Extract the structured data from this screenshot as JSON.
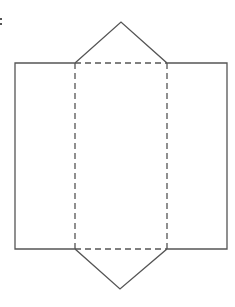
{
  "figure": {
    "colors": {
      "stroke": "#555555",
      "background": "#ffffff"
    },
    "points": {
      "top_apex": [
        121,
        22
      ],
      "bottom_apex": [
        120,
        289
      ],
      "outer_left": 15,
      "inner_left": 75,
      "inner_right": 167,
      "outer_right": 227,
      "top": 63,
      "bottom": 249
    },
    "faces": [
      {
        "name": "left-rectangle",
        "type": "solid"
      },
      {
        "name": "center-rectangle",
        "type": "dashed-fold"
      },
      {
        "name": "right-rectangle",
        "type": "solid"
      },
      {
        "name": "top-triangle",
        "type": "solid"
      },
      {
        "name": "bottom-triangle",
        "type": "solid"
      }
    ]
  }
}
